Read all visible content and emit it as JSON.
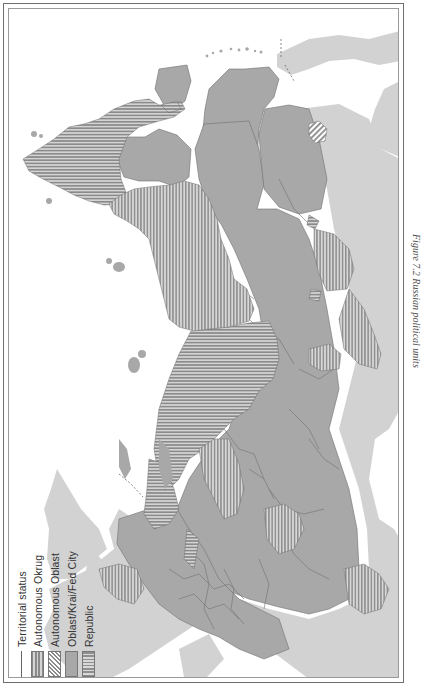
{
  "figure": {
    "caption": "Figure 7.2 Russian political units",
    "orientation": "rotated 90° (landscape map printed on portrait page)"
  },
  "legend": {
    "title": "Territorial status",
    "items": [
      {
        "label": "Autonomous Okrug",
        "pattern": "horizontal-stripes"
      },
      {
        "label": "Autonomous Oblast",
        "pattern": "diagonal-stripes"
      },
      {
        "label": "Oblast/Krai/Fed City",
        "pattern": "solid-gray"
      },
      {
        "label": "Republic",
        "pattern": "vertical-stripes"
      }
    ]
  },
  "colors": {
    "water": "#ffffff",
    "foreign_land": "#d2d2d2",
    "oblast_fill": "#a8a8a8",
    "stripe_dark": "#8a8a8a",
    "stripe_light": "#d8d8d8",
    "border_line": "#6a6a6a",
    "frame": "#6e6e6e"
  }
}
